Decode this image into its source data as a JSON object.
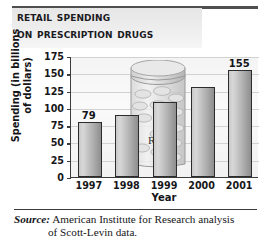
{
  "title": {
    "line1": "Retail Spending",
    "line2": "on Prescription Drugs"
  },
  "axes": {
    "ylabel_line1": "Spending (in billions",
    "ylabel_line2": "of dollars)",
    "xlabel": "Year"
  },
  "source": {
    "label": "Source:",
    "line1": " American Institute for Research analysis",
    "line2": "of Scott-Levin data."
  },
  "artwork": {
    "bottle_label": "Rx",
    "bottle_name": "prescription-pill-bottle"
  },
  "colors": {
    "bar_light": "#d8d8d8",
    "bar_dark": "#8e8e8e",
    "bar_outline": "#2c2c2c",
    "axis": "#3c3c3c",
    "gridline": "#d2d2d2",
    "title_band": "#ececec",
    "rule": "#4f4f52",
    "text": "#141417"
  },
  "chart_data": {
    "type": "bar",
    "title": "Retail Spending on Prescription Drugs",
    "xlabel": "Year",
    "ylabel": "Spending (in billions of dollars)",
    "categories": [
      "1997",
      "1998",
      "1999",
      "2000",
      "2001"
    ],
    "values": [
      79,
      89,
      108,
      130,
      155
    ],
    "data_labels": [
      "79",
      "",
      "",
      "",
      "155"
    ],
    "ylim": [
      0,
      175
    ],
    "yticks": [
      0,
      25,
      50,
      75,
      100,
      125,
      150,
      175
    ],
    "ytick_labels": [
      "0",
      "25",
      "50",
      "75",
      "100",
      "125",
      "150",
      "175"
    ],
    "grid": true,
    "legend": "none",
    "units": "billions of dollars",
    "source": "American Institute for Research analysis of Scott-Levin data."
  }
}
